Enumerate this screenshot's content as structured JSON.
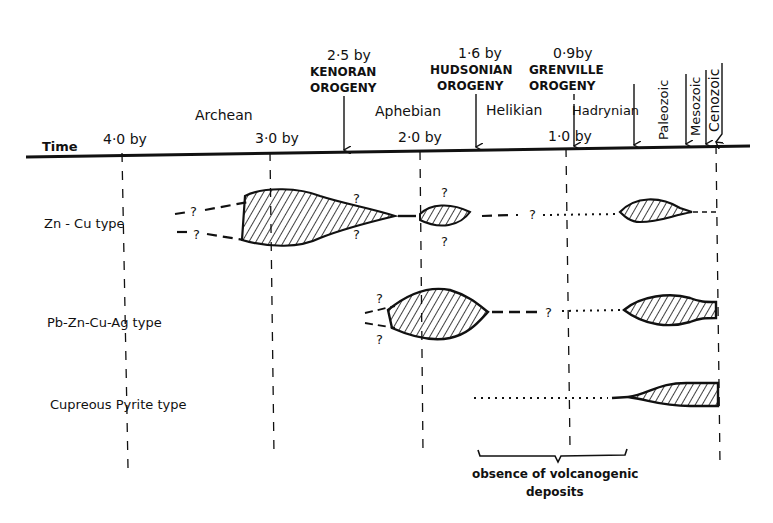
{
  "header": {
    "time_label": "Time",
    "ticks": [
      {
        "label": "4·0 by",
        "x": 127
      },
      {
        "label": "3·0 by",
        "x": 270
      },
      {
        "label": "2·0 by",
        "x": 420
      },
      {
        "label": "1·0 by",
        "x": 566
      },
      {
        "label": "",
        "x": 717
      }
    ],
    "eons": [
      {
        "label": "Archean",
        "x": 229,
        "y": 118
      },
      {
        "label": "Aphebian",
        "x": 412,
        "y": 115
      },
      {
        "label": "Helikian",
        "x": 513,
        "y": 115
      },
      {
        "label": "Hadrynian",
        "x": 612,
        "y": 115
      }
    ],
    "vertical_eras": [
      {
        "label": "Paleozoic",
        "x": 665
      },
      {
        "label": "Mesozoic",
        "x": 699
      },
      {
        "label": "Cenozoic",
        "x": 719
      }
    ],
    "orogenies": [
      {
        "age": "2·5 by",
        "name1": "KENORAN",
        "name2": "OROGENY",
        "x": 346
      },
      {
        "age": "1·6 by",
        "name1": "HUDSONIAN",
        "name2": "OROGENY",
        "x": 475
      },
      {
        "age": "0·9by",
        "name1": "GRENVILLE",
        "name2": "OROGENY",
        "x": 572
      }
    ]
  },
  "rows": [
    {
      "label": "Zn - Cu type",
      "y": 222
    },
    {
      "label": "Pb-Zn-Cu-Ag type",
      "y": 321
    },
    {
      "label": "Cupreous Pyrite type",
      "y": 403
    }
  ],
  "annotations": {
    "question_mark": "?",
    "gap_line1": "obsence of volcanogenic",
    "gap_line2": "deposits"
  },
  "colors": {
    "ink": "#111111",
    "background": "#ffffff"
  }
}
